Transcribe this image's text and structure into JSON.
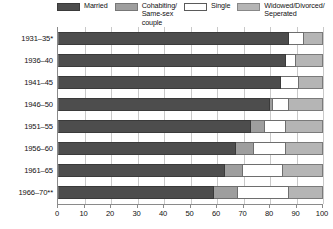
{
  "chart_data": {
    "type": "bar",
    "orientation": "horizontal",
    "stacked": true,
    "normalized_percent": true,
    "title": "",
    "subtitle": "",
    "xlabel": "",
    "ylabel": "",
    "xlim": [
      0,
      100
    ],
    "grid": true,
    "legend_position": "top",
    "xticks": [
      "0",
      "10",
      "20",
      "30",
      "40",
      "50",
      "60",
      "70",
      "80",
      "90",
      "100"
    ],
    "xtick_values": [
      0,
      10,
      20,
      30,
      40,
      50,
      60,
      70,
      80,
      90,
      100
    ],
    "categories": [
      "1931–35*",
      "1936–40",
      "1941–45",
      "1946–50",
      "1951–55",
      "1956–60",
      "1961–65",
      "1966–70**"
    ],
    "series": [
      {
        "name": "Married",
        "color": "#4d4d4d",
        "values": [
          87,
          86,
          84,
          80,
          73,
          67,
          63,
          59
        ]
      },
      {
        "name": "Cohabiting/\nSame-sex couple",
        "color": "#9e9e9e",
        "values": [
          0,
          0,
          0,
          1,
          5,
          7,
          7,
          9
        ]
      },
      {
        "name": "Single",
        "color": "#ffffff",
        "values": [
          6,
          4,
          7,
          6,
          8,
          12,
          15,
          19
        ]
      },
      {
        "name": "Widowed/Divorced/\nSeperated",
        "color": "#b5b5b5",
        "values": [
          7,
          10,
          9,
          13,
          14,
          14,
          15,
          13
        ]
      }
    ]
  },
  "legend": {
    "items": [
      {
        "label": "Married",
        "swatch_class": "sw-married"
      },
      {
        "label": "Cohabiting/\nSame-sex couple",
        "swatch_class": "sw-cohabiting"
      },
      {
        "label": "Single",
        "swatch_class": "sw-single"
      },
      {
        "label": "Widowed/Divorced/\nSeperated",
        "swatch_class": "sw-widowed"
      }
    ]
  }
}
